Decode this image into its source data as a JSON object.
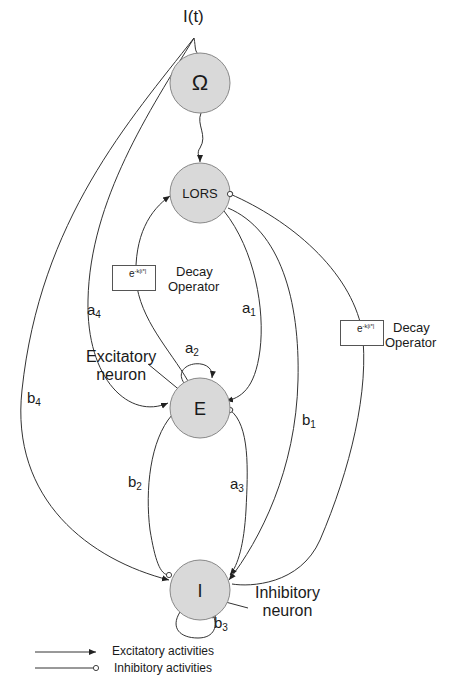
{
  "input": {
    "label": "I(t)"
  },
  "nodes": {
    "omega": {
      "label": "Ω",
      "fill": "#d9d9d9"
    },
    "lors": {
      "label": "LORS",
      "fill": "#d9d9d9"
    },
    "e": {
      "label": "E",
      "fill": "#d9d9d9"
    },
    "i": {
      "label": "I",
      "fill": "#d9d9d9"
    }
  },
  "coefficients": {
    "a1": {
      "base": "a",
      "sub": "1"
    },
    "a2": {
      "base": "a",
      "sub": "2"
    },
    "a3": {
      "base": "a",
      "sub": "3"
    },
    "a4": {
      "base": "a",
      "sub": "4"
    },
    "b1": {
      "base": "b",
      "sub": "1"
    },
    "b2": {
      "base": "b",
      "sub": "2"
    },
    "b3": {
      "base": "b",
      "sub": "3"
    },
    "b4": {
      "base": "b",
      "sub": "4"
    }
  },
  "decay_operators": [
    {
      "expr_base": "e",
      "expr_sup": "-k|i*|",
      "line1": "Decay",
      "line2": "Operator"
    },
    {
      "expr_base": "e",
      "expr_sup": "-k|i*|",
      "line1": "Decay",
      "line2": "Operator"
    }
  ],
  "annotations": {
    "excitatory_neuron": {
      "line1": "Excitatory",
      "line2": "neuron"
    },
    "inhibitory_neuron": {
      "line1": "Inhibitory",
      "line2": "neuron"
    }
  },
  "legend": {
    "excitatory": "Excitatory activities",
    "inhibitory": "Inhibitory activities"
  },
  "colors": {
    "line": "#333333",
    "node_fill": "#d9d9d9",
    "node_stroke": "#888888"
  }
}
